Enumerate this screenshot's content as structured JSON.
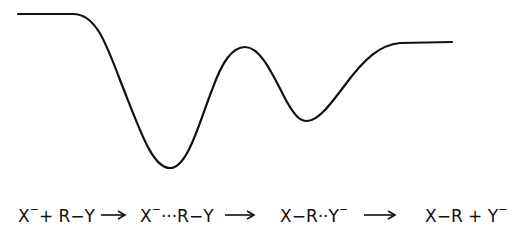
{
  "diagram": {
    "type": "reaction-energy-profile",
    "curve": {
      "stroke": "#111111",
      "points_description": "flat start, deep first well, central barrier, shallower second well, flat end",
      "key_points": [
        {
          "name": "reactants-plateau",
          "x": 18,
          "y": 14
        },
        {
          "name": "ion-dipole-complex-1-minimum",
          "x": 170,
          "y": 168
        },
        {
          "name": "transition-state-peak",
          "x": 245,
          "y": 47
        },
        {
          "name": "ion-dipole-complex-2-minimum",
          "x": 307,
          "y": 121
        },
        {
          "name": "products-plateau",
          "x": 452,
          "y": 42
        }
      ]
    },
    "stages": [
      {
        "id": "reactants",
        "parts": [
          {
            "t": "X"
          },
          {
            "t": "−",
            "sup": true
          },
          {
            "t": "+R−Y"
          }
        ]
      },
      {
        "id": "complex-1",
        "parts": [
          {
            "t": "X"
          },
          {
            "t": "−",
            "sup": true
          },
          {
            "t": "···R−Y"
          }
        ]
      },
      {
        "id": "complex-2",
        "parts": [
          {
            "t": "X−R··Y"
          },
          {
            "t": "−",
            "sup": true
          }
        ]
      },
      {
        "id": "products",
        "parts": [
          {
            "t": "X−R+Y"
          },
          {
            "t": "−",
            "sup": true
          }
        ]
      }
    ],
    "labels": {
      "s1_a": "X",
      "s1_b": "−",
      "s1_c": "+ R−Y",
      "s2_a": "X",
      "s2_b": "−",
      "s2_c": "···R−Y",
      "s3_a": "X−R··Y",
      "s3_b": "−",
      "s4_a": "X−R + Y",
      "s4_b": "−"
    },
    "arrow_count": 3
  }
}
